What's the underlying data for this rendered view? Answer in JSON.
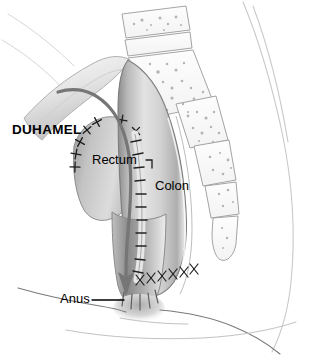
{
  "figure": {
    "type": "medical-illustration",
    "background_color": "#ffffff",
    "width": 328,
    "height": 355
  },
  "labels": {
    "title": "DUHAMEL",
    "rectum": "Rectum",
    "colon": "Colon",
    "anus": "Anus"
  },
  "colors": {
    "ink": "#000000",
    "outline": "#6b6b6b",
    "faint_outline": "#c9c9c9",
    "tissue_light": "#f2f2f2",
    "tissue_mid": "#cfcfcf",
    "tissue_dark": "#8f8f8f",
    "arrow": "#767676",
    "bone_outline": "#9a9a9a"
  },
  "annotations": {
    "arrow_description": "Curved gray arrow showing the pulled-through colon passing downward behind the rectum to the anus",
    "suture_description": "Ladder of staple/suture marks along the side-to-side colorectal anastomosis",
    "stump_suture_description": "Interrupted sutures closing the rectal stump",
    "perineal_suture_description": "X-shaped interrupted sutures at the distal anastomosis",
    "anus_leader": "Leader line from the Anus label to the anal canal",
    "rectum_leader": "Small hook leader from the Rectum label",
    "spine_description": "Stippled lumbar vertebrae, sacrum and coccyx segments along the posterior pelvis",
    "body_contour_description": "Faint contour of the buttock, thigh and perineum"
  }
}
